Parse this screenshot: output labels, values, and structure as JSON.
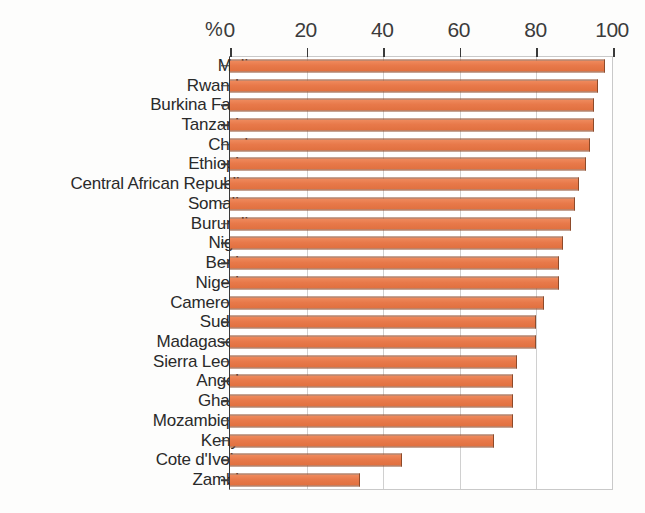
{
  "axis": {
    "unit_symbol": "%",
    "ticks": [
      0,
      20,
      40,
      60,
      80,
      100
    ],
    "tick_labels": [
      "0",
      "20",
      "40",
      "60",
      "80",
      "100"
    ]
  },
  "colors": {
    "bar_fill": "#e8794a",
    "bar_outline": "#8d4a2a",
    "gridline": "#d0d0d0",
    "axis": "#3a3a3a",
    "text": "#2a2a2a",
    "background": "#ffffff"
  },
  "chart_data": {
    "type": "bar",
    "orientation": "horizontal",
    "title": "",
    "subtitle": "",
    "xlabel": "%",
    "ylabel": "",
    "xlim": [
      0,
      100
    ],
    "grid": true,
    "legend": "none",
    "categories": [
      "Mali",
      "Rwanda",
      "Burkina Faso",
      "Tanzania",
      "Chad",
      "Ethiopia",
      "Central African Republic",
      "Somalia",
      "Burundi",
      "Niger",
      "Benin",
      "Nigeria",
      "Cameroon",
      "Sudan",
      "Madagascar",
      "Sierra Leone",
      "Angola",
      "Ghana",
      "Mozambique",
      "Kenya",
      "Cote d'Ivoire",
      "Zambia"
    ],
    "values": [
      98,
      96,
      95,
      95,
      94,
      93,
      91,
      90,
      89,
      87,
      86,
      86,
      82,
      80,
      80,
      75,
      74,
      74,
      74,
      69,
      45,
      34
    ]
  }
}
